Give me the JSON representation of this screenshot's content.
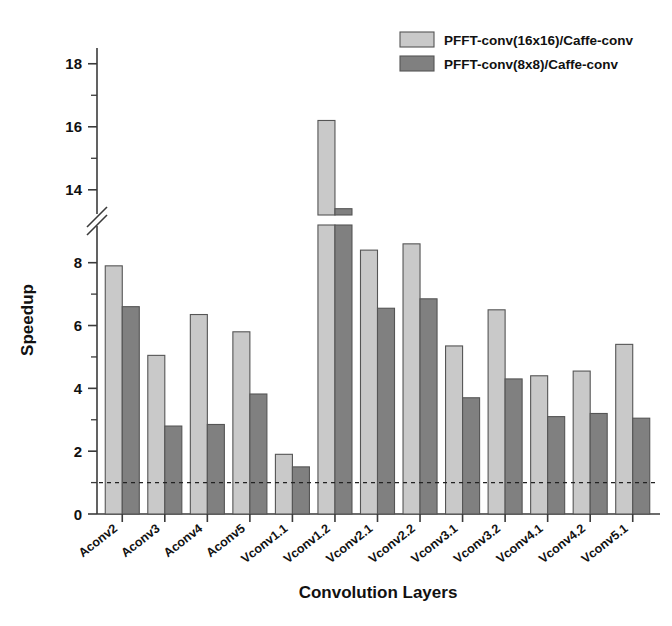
{
  "chart_data": {
    "type": "bar",
    "title": "",
    "xlabel": "Convolution Layers",
    "ylabel": "Speedup",
    "grid": false,
    "legend_position": "top-right",
    "categories": [
      "Aconv2",
      "Aconv3",
      "Aconv4",
      "Aconv5",
      "Vconv1.1",
      "Vconv1.2",
      "Vconv2.1",
      "Vconv2.2",
      "Vconv3.1",
      "Vconv3.2",
      "Vconv4.1",
      "Vconv4.2",
      "Vconv5.1"
    ],
    "series": [
      {
        "name": "PFFT-conv(16x16)/Caffe-conv",
        "color": "#c9c9c9",
        "values": [
          7.9,
          5.05,
          6.35,
          5.8,
          1.9,
          16.2,
          8.4,
          8.6,
          5.35,
          6.5,
          4.4,
          4.55,
          5.4
        ]
      },
      {
        "name": "PFFT-conv(8x8)/Caffe-conv",
        "color": "#808080",
        "values": [
          6.6,
          2.8,
          2.85,
          3.82,
          1.5,
          13.4,
          6.55,
          6.85,
          3.7,
          4.3,
          3.1,
          3.2,
          3.05
        ]
      }
    ],
    "reference_line": {
      "value": 1.0,
      "style": "dashed"
    },
    "y_axis": {
      "label": "Speedup",
      "broken": true,
      "lower_range": [
        0,
        9.2
      ],
      "upper_range": [
        13.2,
        18.5
      ],
      "major_ticks_lower": [
        0,
        2,
        4,
        6,
        8
      ],
      "minor_ticks_lower": [
        1,
        3,
        5,
        7
      ],
      "major_ticks_upper": [
        14,
        16,
        18
      ],
      "minor_ticks_upper": [
        15,
        17
      ],
      "tick_labels": [
        "0",
        "2",
        "4",
        "6",
        "8",
        "14",
        "16",
        "18"
      ]
    }
  },
  "legend": {
    "entries": [
      {
        "label": "PFFT-conv(16x16)/Caffe-conv",
        "color": "#c9c9c9"
      },
      {
        "label": "PFFT-conv(8x8)/Caffe-conv",
        "color": "#808080"
      }
    ]
  }
}
